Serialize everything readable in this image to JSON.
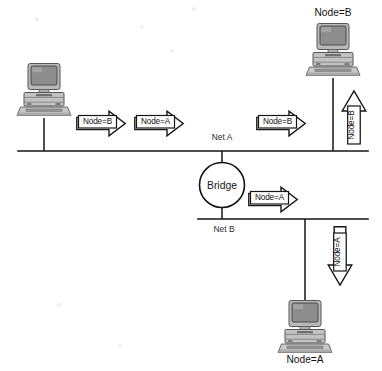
{
  "diagram": {
    "type": "network-topology",
    "background_color": "#ffffff",
    "line_color": "#141414",
    "icon_fill": "#bdbdbd"
  },
  "segments": [
    {
      "id": "net-a",
      "label": "Net A",
      "label_x": 222,
      "label_y": 140,
      "y": 151,
      "x1": 18,
      "x2": 368
    },
    {
      "id": "net-b",
      "label": "Net B",
      "label_x": 224,
      "label_y": 232,
      "y": 219,
      "x1": 198,
      "x2": 368
    }
  ],
  "bridge": {
    "label": "Bridge",
    "cx": 222,
    "cy": 185,
    "r": 22.5,
    "stem_top_y": 151,
    "stem_bottom_y": 219
  },
  "hosts": [
    {
      "id": "host-left",
      "label": "",
      "label_position": "none",
      "x": 16,
      "y": 62,
      "width": 56,
      "height": 56,
      "segment": "net-a",
      "drop_x": 44,
      "drop_from_y": 118,
      "drop_to_y": 151
    },
    {
      "id": "host-node-b",
      "label": "Node=B",
      "label_position": "above",
      "label_x": 333,
      "label_y": 16,
      "x": 305,
      "y": 22,
      "width": 56,
      "height": 56,
      "segment": "net-a",
      "drop_x": 333,
      "drop_from_y": 78,
      "drop_to_y": 151
    },
    {
      "id": "host-node-a",
      "label": "Node=A",
      "label_position": "below",
      "label_x": 305,
      "label_y": 363,
      "x": 277,
      "y": 299,
      "width": 56,
      "height": 56,
      "segment": "net-b",
      "drop_x": 305,
      "drop_from_y": 219,
      "drop_to_y": 299
    }
  ],
  "packets": [
    {
      "id": "packet-net-a-node-b-1",
      "label": "Node=B",
      "direction": "right",
      "segment": "net-a",
      "x": 76,
      "y": 110,
      "length": 50,
      "thickness": 27
    },
    {
      "id": "packet-net-a-node-a",
      "label": "Node=A",
      "direction": "right",
      "segment": "net-a",
      "x": 134,
      "y": 110,
      "length": 50,
      "thickness": 27
    },
    {
      "id": "packet-net-a-node-b-2",
      "label": "Node=B",
      "direction": "right",
      "segment": "net-a",
      "x": 256,
      "y": 110,
      "length": 50,
      "thickness": 27
    },
    {
      "id": "packet-up-node-b",
      "label": "Node=B",
      "direction": "up",
      "segment": "net-a",
      "x": 341,
      "y": 90,
      "length": 54,
      "thickness": 26
    },
    {
      "id": "packet-net-b-node-a",
      "label": "Node=A",
      "direction": "right",
      "segment": "net-b",
      "x": 248,
      "y": 186,
      "length": 50,
      "thickness": 27
    },
    {
      "id": "packet-down-node-a",
      "label": "Node=A",
      "direction": "down",
      "segment": "net-b",
      "x": 327,
      "y": 226,
      "length": 60,
      "thickness": 26
    }
  ]
}
